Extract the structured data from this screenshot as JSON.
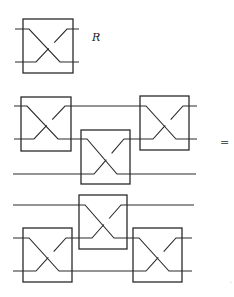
{
  "diagram": {
    "title_gate": {
      "label": "R",
      "box": {
        "x": 23,
        "y": 19,
        "w": 50,
        "h": 54
      },
      "wires_y": [
        29,
        62
      ],
      "wire_x": [
        15,
        79
      ]
    },
    "equals_symbol": "=",
    "corner_mark": "’",
    "lhs": {
      "description": "Three-wire circuit: R on wires 1-2, then R on wires 2-3, then R on wires 1-2",
      "wires": [
        {
          "y": 106,
          "x1": 14,
          "x2": 197
        },
        {
          "y": 139,
          "x1": 14,
          "x2": 197
        },
        {
          "y": 174,
          "x1": 13,
          "x2": 196
        }
      ],
      "gates": [
        {
          "name": "R",
          "wires": [
            1,
            2
          ],
          "box": {
            "x": 21,
            "y": 97,
            "w": 50,
            "h": 54
          }
        },
        {
          "name": "R",
          "wires": [
            2,
            3
          ],
          "box": {
            "x": 81,
            "y": 130,
            "w": 49,
            "h": 54
          }
        },
        {
          "name": "R",
          "wires": [
            1,
            2
          ],
          "box": {
            "x": 140,
            "y": 96,
            "w": 49,
            "h": 54
          }
        }
      ]
    },
    "rhs": {
      "description": "Three-wire circuit: R on wires 2-3, then R on wires 1-2, then R on wires 2-3",
      "wires": [
        {
          "y": 205,
          "x1": 13,
          "x2": 194
        },
        {
          "y": 238,
          "x1": 13,
          "x2": 192
        },
        {
          "y": 271,
          "x1": 13,
          "x2": 192
        }
      ],
      "gates": [
        {
          "name": "R",
          "wires": [
            2,
            3
          ],
          "box": {
            "x": 23,
            "y": 228,
            "w": 49,
            "h": 54
          }
        },
        {
          "name": "R",
          "wires": [
            1,
            2
          ],
          "box": {
            "x": 79,
            "y": 195,
            "w": 48,
            "h": 54
          }
        },
        {
          "name": "R",
          "wires": [
            2,
            3
          ],
          "box": {
            "x": 133,
            "y": 228,
            "w": 49,
            "h": 54
          }
        }
      ]
    }
  }
}
